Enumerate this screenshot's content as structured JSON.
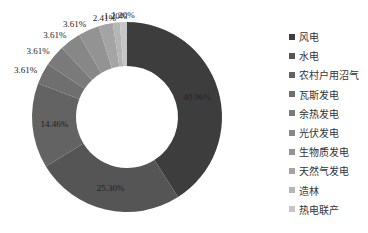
{
  "chart_data": {
    "type": "pie",
    "subtype": "donut",
    "title": "",
    "legend_position": "right",
    "start_angle": "12 o'clock",
    "direction": "clockwise",
    "categories": [
      "风电",
      "水电",
      "农村户用沼气",
      "瓦斯发电",
      "余热发电",
      "光伏发电",
      "生物质发电",
      "天然气发电",
      "造林",
      "热电联产"
    ],
    "values": [
      40.96,
      25.3,
      14.46,
      3.61,
      3.61,
      3.61,
      3.61,
      2.41,
      1.2,
      1.2
    ],
    "labels": [
      "40.96%",
      "25.30%",
      "14.46%",
      "3.61%",
      "3.61%",
      "3.61%",
      "3.61%",
      "2.41%",
      "1.20%",
      "1.20%"
    ],
    "colors": [
      "#3d3d3d",
      "#555555",
      "#636363",
      "#6f6f6f",
      "#7a7a7a",
      "#878787",
      "#939393",
      "#a4a4a4",
      "#b5b5b5",
      "#c6c6c6"
    ]
  },
  "geometry": {
    "cx": 127,
    "cy": 117,
    "r_outer": 95,
    "r_inner": 51
  },
  "legend": {
    "items": [
      {
        "label": "风电"
      },
      {
        "label": "水电"
      },
      {
        "label": "农村户用沼气"
      },
      {
        "label": "瓦斯发电"
      },
      {
        "label": "余热发电"
      },
      {
        "label": "光伏发电"
      },
      {
        "label": "生物质发电"
      },
      {
        "label": "天然气发电"
      },
      {
        "label": "造林"
      },
      {
        "label": "热电联产"
      }
    ]
  }
}
